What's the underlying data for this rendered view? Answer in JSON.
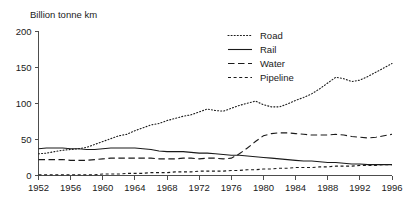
{
  "chart_data": {
    "type": "line",
    "title": "",
    "ylabel": "Billion tonne km",
    "xlabel": "",
    "ylim": [
      0,
      200
    ],
    "xlim": [
      1952,
      1996
    ],
    "yticks": [
      0,
      50,
      100,
      150,
      200
    ],
    "xticks": [
      1952,
      1956,
      1960,
      1964,
      1968,
      1972,
      1976,
      1980,
      1984,
      1988,
      1992,
      1996
    ],
    "grid": false,
    "legend_position": "top-right",
    "x": [
      1952,
      1953,
      1954,
      1955,
      1956,
      1957,
      1958,
      1959,
      1960,
      1961,
      1962,
      1963,
      1964,
      1965,
      1966,
      1967,
      1968,
      1969,
      1970,
      1971,
      1972,
      1973,
      1974,
      1975,
      1976,
      1977,
      1978,
      1979,
      1980,
      1981,
      1982,
      1983,
      1984,
      1985,
      1986,
      1987,
      1988,
      1989,
      1990,
      1991,
      1992,
      1993,
      1994,
      1995,
      1996
    ],
    "series": [
      {
        "name": "Road",
        "style": "dotted",
        "values": [
          30,
          31,
          33,
          35,
          36,
          37,
          39,
          43,
          47,
          51,
          55,
          57,
          62,
          66,
          70,
          72,
          76,
          79,
          82,
          84,
          88,
          92,
          90,
          89,
          93,
          97,
          100,
          103,
          98,
          95,
          95,
          99,
          104,
          108,
          113,
          120,
          128,
          136,
          134,
          130,
          132,
          137,
          143,
          149,
          155
        ]
      },
      {
        "name": "Rail",
        "style": "solid",
        "values": [
          37,
          38,
          38,
          38,
          37,
          37,
          36,
          36,
          37,
          38,
          38,
          38,
          38,
          37,
          36,
          34,
          33,
          33,
          33,
          32,
          31,
          31,
          30,
          29,
          28,
          28,
          27,
          26,
          25,
          24,
          23,
          22,
          21,
          20,
          20,
          19,
          18,
          18,
          17,
          16,
          16,
          15,
          15,
          15,
          15
        ]
      },
      {
        "name": "Water",
        "style": "long-dash",
        "values": [
          22,
          22,
          22,
          22,
          21,
          21,
          21,
          22,
          23,
          24,
          24,
          24,
          24,
          24,
          24,
          23,
          23,
          23,
          24,
          24,
          23,
          24,
          24,
          23,
          24,
          30,
          38,
          47,
          55,
          58,
          59,
          59,
          58,
          57,
          56,
          56,
          56,
          57,
          56,
          54,
          53,
          52,
          53,
          55,
          57
        ]
      },
      {
        "name": "Pipeline",
        "style": "short-dash",
        "values": [
          1,
          1,
          1,
          1,
          1,
          1,
          1,
          1,
          2,
          2,
          2,
          3,
          3,
          3,
          4,
          4,
          4,
          5,
          5,
          5,
          6,
          6,
          6,
          6,
          7,
          7,
          8,
          8,
          9,
          9,
          10,
          10,
          11,
          11,
          11,
          12,
          12,
          13,
          13,
          13,
          14,
          14,
          14,
          15,
          15
        ]
      }
    ]
  },
  "legend": {
    "items": [
      {
        "label": "Road"
      },
      {
        "label": "Rail"
      },
      {
        "label": "Water"
      },
      {
        "label": "Pipeline"
      }
    ]
  }
}
